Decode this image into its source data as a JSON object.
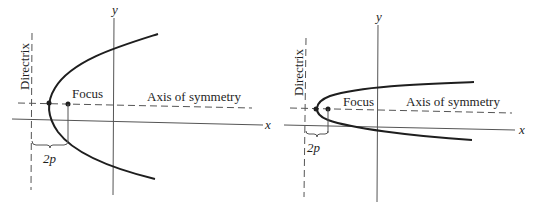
{
  "colors": {
    "ink": "#1e1e1e",
    "axis": "#555555",
    "background": "#ffffff"
  },
  "diagrams": [
    {
      "id": "wide-parabola",
      "labels": {
        "y_axis": "y",
        "x_axis": "x",
        "directrix": "Directrix",
        "focus": "Focus",
        "axis_of_symmetry": "Axis of symmetry",
        "distance": "2p"
      }
    },
    {
      "id": "narrow-parabola",
      "labels": {
        "y_axis": "y",
        "x_axis": "x",
        "directrix": "Directrix",
        "focus": "Focus",
        "axis_of_symmetry": "Axis of symmetry",
        "distance": "2p"
      }
    }
  ]
}
